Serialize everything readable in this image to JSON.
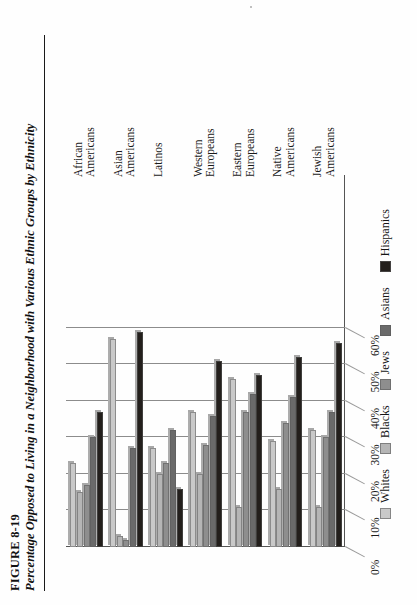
{
  "figure": {
    "number": "FIGURE 8-19",
    "title": "Percentage Opposed to Living in a Neighborhood with Various Ethnic Groups by Ethnicity"
  },
  "chart_data": {
    "type": "bar",
    "orientation": "vertical-grouped-rendered-rotated",
    "title": "Percentage Opposed to Living in a Neighborhood with Various Ethnic Groups by Ethnicity",
    "xlabel": "",
    "ylabel": "",
    "ylim": [
      0,
      60
    ],
    "ytick_labels": [
      "0%",
      "10%",
      "20%",
      "30%",
      "40%",
      "50%",
      "60%"
    ],
    "ytick_values": [
      0,
      10,
      20,
      30,
      40,
      50,
      60
    ],
    "grid": true,
    "legend_position": "bottom",
    "categories": [
      "African\nAmericans",
      "Asian\nAmericans",
      "Latinos",
      "Western\nEuropeans",
      "Eastern\nEuropeans",
      "Native\nAmericans",
      "Jewish\nAmericans"
    ],
    "series": [
      {
        "name": "Whites",
        "color": "#c9c9c9",
        "values": [
          23,
          57,
          27,
          37,
          46,
          29,
          32
        ]
      },
      {
        "name": "Blacks",
        "color": "#b5b5b5",
        "values": [
          15,
          3,
          20,
          20,
          11,
          16,
          11
        ]
      },
      {
        "name": "Jews",
        "color": "#8e8e8e",
        "values": [
          17,
          2,
          23,
          28,
          37,
          34,
          30
        ]
      },
      {
        "name": "Asians",
        "color": "#6a6a6a",
        "values": [
          30,
          27,
          32,
          36,
          42,
          41,
          37
        ]
      },
      {
        "name": "Hispanics",
        "color": "#231f1c",
        "values": [
          37,
          59,
          16,
          51,
          47,
          52,
          56
        ]
      }
    ]
  },
  "legend": {
    "items": [
      {
        "label": "Whites",
        "color": "#c9c9c9"
      },
      {
        "label": "Blacks",
        "color": "#b5b5b5"
      },
      {
        "label": "Jews",
        "color": "#8e8e8e"
      },
      {
        "label": "Asians",
        "color": "#6a6a6a"
      },
      {
        "label": "Hispanics",
        "color": "#231f1c"
      }
    ]
  }
}
